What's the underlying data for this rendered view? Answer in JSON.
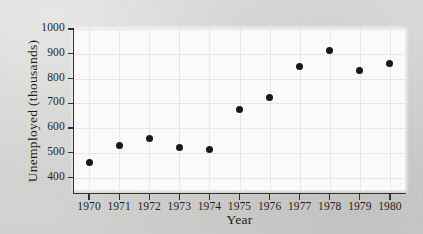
{
  "chart_data": {
    "type": "scatter",
    "title": "",
    "xlabel": "Year",
    "ylabel": "Unemployed (thousands)",
    "x": [
      1970,
      1971,
      1972,
      1973,
      1974,
      1975,
      1976,
      1977,
      1978,
      1979,
      1980
    ],
    "values": [
      463,
      528,
      558,
      520,
      513,
      675,
      725,
      847,
      915,
      833,
      860
    ],
    "xtick_labels": [
      "1970",
      "1971",
      "1972",
      "1973",
      "1974",
      "1975",
      "1976",
      "1977",
      "1978",
      "1979",
      "1980"
    ],
    "ytick_labels": [
      "400",
      "500",
      "600",
      "700",
      "800",
      "900",
      "1000"
    ],
    "ytick_values": [
      400,
      500,
      600,
      700,
      800,
      900,
      1000
    ],
    "xlim": [
      1969.5,
      1980.5
    ],
    "ylim": [
      350,
      1000
    ],
    "grid": true,
    "legend": null,
    "marker_color": "#151515",
    "panel_color": "#fdfdfd",
    "grid_color": "#eaeaea",
    "axis_color": "#2f2f2f",
    "background_color": "#d8d8d6"
  }
}
